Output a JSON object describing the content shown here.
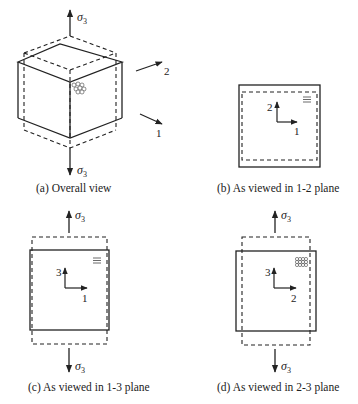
{
  "figure": {
    "panels": [
      {
        "id": "a",
        "caption": "(a) Overall view",
        "stress_label_top": "σ",
        "stress_sub_top": "3",
        "stress_label_bottom": "σ",
        "stress_sub_bottom": "3",
        "axis_labels": [
          "2",
          "1"
        ]
      },
      {
        "id": "b",
        "caption": "(b) As viewed in 1-2 plane",
        "axis_vertical": "2",
        "axis_horizontal": "1"
      },
      {
        "id": "c",
        "caption": "(c) As viewed in 1-3 plane",
        "stress_label_top": "σ",
        "stress_sub_top": "3",
        "stress_label_bottom": "σ",
        "stress_sub_bottom": "3",
        "axis_vertical": "3",
        "axis_horizontal": "1"
      },
      {
        "id": "d",
        "caption": "(d) As viewed in 2-3 plane",
        "stress_label_top": "σ",
        "stress_sub_top": "3",
        "stress_label_bottom": "σ",
        "stress_sub_bottom": "3",
        "axis_vertical": "3",
        "axis_horizontal": "2"
      }
    ],
    "colors": {
      "line": "#222222",
      "background": "#ffffff"
    }
  }
}
